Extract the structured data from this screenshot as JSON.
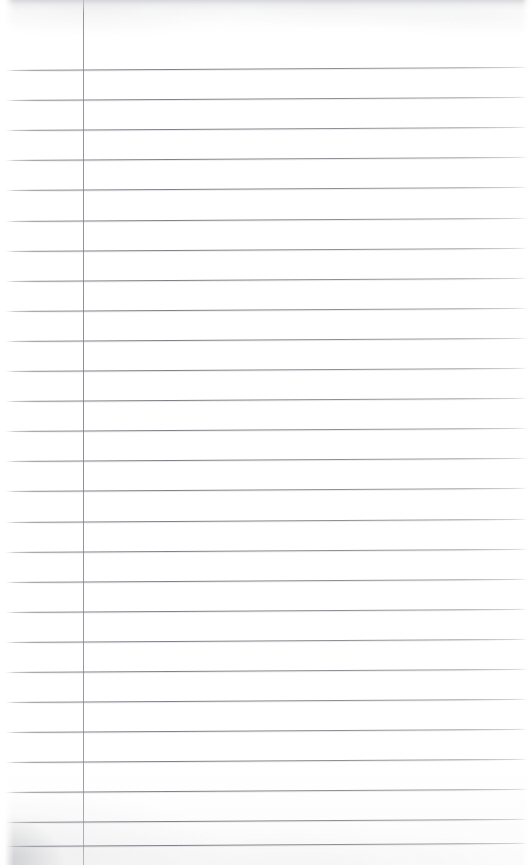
{
  "document": {
    "kind": "scanned-ruled-notepad-page",
    "title": "Blank Ruled Notepad Page",
    "content_text": "",
    "page_width": 532,
    "page_height": 865,
    "background_color": "#ffffff",
    "paper_tone": "#fdfdfd"
  },
  "ruling": {
    "rule_color": "#767880",
    "rule_thickness": 1,
    "first_rule_y": 70,
    "rule_spacing": 30.1,
    "rule_count": 27,
    "rule_tilt_degrees": -0.35,
    "rule_left_inset": 0,
    "rule_right_inset": 0,
    "rule_ys": [
      70,
      100,
      130,
      160,
      190,
      221,
      251,
      281,
      311,
      341,
      371,
      401,
      431,
      461,
      491,
      522,
      552,
      582,
      612,
      642,
      672,
      702,
      732,
      762,
      792,
      822,
      846
    ]
  },
  "margin_line": {
    "label": "vertical-margin-rule",
    "x": 83,
    "color": "#80828a",
    "thickness": 1,
    "top": 0,
    "bottom": 865
  },
  "artifacts": {
    "top_shadow_band_height": 10,
    "bottom_left_corner_shadow": true,
    "left_edge_fade_width": 14,
    "right_edge_fade_width": 10,
    "blemishes": [
      {
        "name": "rule-lightening-smudge",
        "x": 230,
        "y": 686,
        "width": 120
      }
    ]
  }
}
